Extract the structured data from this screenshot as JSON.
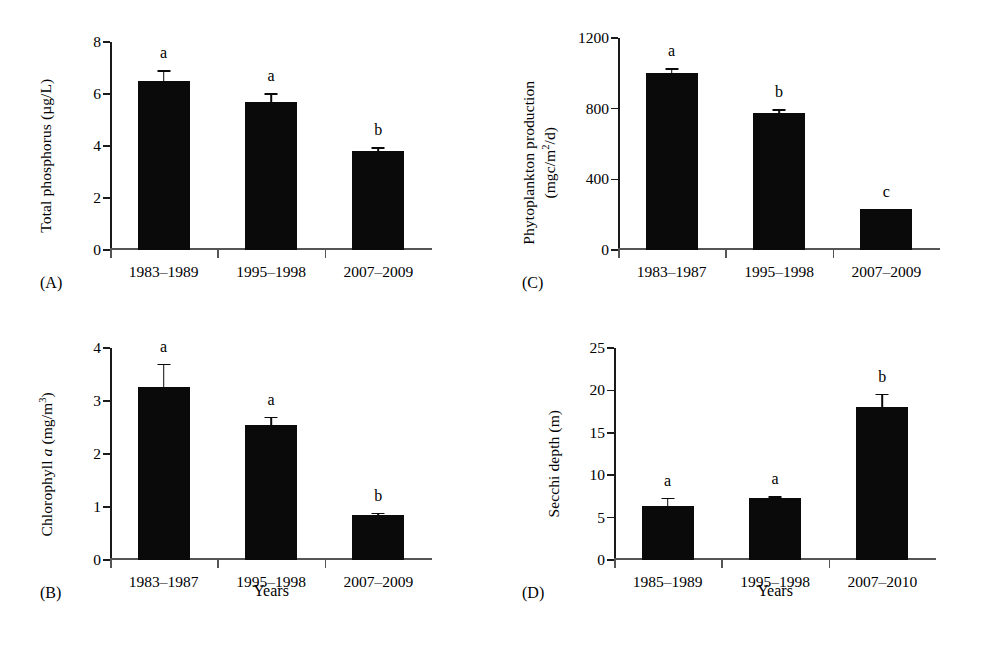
{
  "figure": {
    "background": "#ffffff",
    "bar_color": "#0a0a0a",
    "axis_color": "#1a1a1a"
  },
  "panels": [
    {
      "tag": "(A)",
      "ylabel": "Total phosphorus (µg/L)",
      "xaxis_title": "",
      "yticks": [
        "0",
        "2",
        "4",
        "6",
        "8"
      ]
    },
    {
      "tag": "(B)",
      "ylabel_prefix": "Chlorophyll ",
      "ylabel_italic": "a",
      "ylabel_suffix": " (mg/m",
      "ylabel_sup": "3",
      "ylabel_end": ")",
      "xaxis_title": "Years",
      "yticks": [
        "0",
        "1",
        "2",
        "3",
        "4"
      ]
    },
    {
      "tag": "(C)",
      "ylabel_line1": "Phytoplankton production",
      "ylabel_line2_prefix": "(mgc/m",
      "ylabel_line2_sup": "2",
      "ylabel_line2_suffix": "/d)",
      "xaxis_title": "",
      "yticks": [
        "0",
        "400",
        "800",
        "1200"
      ]
    },
    {
      "tag": "(D)",
      "ylabel": "Secchi depth (m)",
      "xaxis_title": "Years",
      "yticks": [
        "0",
        "5",
        "10",
        "15",
        "20",
        "25"
      ]
    }
  ],
  "chart_data": [
    {
      "panel": "A",
      "type": "bar",
      "title": "",
      "xlabel": "",
      "ylabel": "Total phosphorus (µg/L)",
      "ylim": [
        0,
        8
      ],
      "yticks": [
        0,
        2,
        4,
        6,
        8
      ],
      "grid": false,
      "legend": "none",
      "categories": [
        "1983–1989",
        "1995–1998",
        "2007–2009"
      ],
      "values": [
        6.5,
        5.68,
        3.8
      ],
      "errors": [
        0.42,
        0.34,
        0.15
      ],
      "annotations": [
        "a",
        "a",
        "b"
      ]
    },
    {
      "panel": "B",
      "type": "bar",
      "title": "",
      "xlabel": "Years",
      "ylabel": "Chlorophyll a (mg/m3)",
      "ylim": [
        0,
        4
      ],
      "yticks": [
        0,
        1,
        2,
        3,
        4
      ],
      "grid": false,
      "legend": "none",
      "categories": [
        "1983–1987",
        "1995–1998",
        "2007–2009"
      ],
      "values": [
        3.26,
        2.55,
        0.84
      ],
      "errors": [
        0.44,
        0.15,
        0.05
      ],
      "annotations": [
        "a",
        "a",
        "b"
      ]
    },
    {
      "panel": "C",
      "type": "bar",
      "title": "",
      "xlabel": "",
      "ylabel": "Phytoplankton production (mgc/m2/d)",
      "ylim": [
        0,
        1200
      ],
      "yticks": [
        0,
        400,
        800,
        1200
      ],
      "grid": false,
      "legend": "none",
      "categories": [
        "1983–1987",
        "1995–1998",
        "2007–2009"
      ],
      "values": [
        1000,
        775,
        230
      ],
      "errors": [
        30,
        22,
        0
      ],
      "annotations": [
        "a",
        "b",
        "c"
      ]
    },
    {
      "panel": "D",
      "type": "bar",
      "title": "",
      "xlabel": "Years",
      "ylabel": "Secchi depth (m)",
      "ylim": [
        0,
        25
      ],
      "yticks": [
        0,
        5,
        10,
        15,
        20,
        25
      ],
      "grid": false,
      "legend": "none",
      "categories": [
        "1985–1989",
        "1995–1998",
        "2007–2010"
      ],
      "values": [
        6.4,
        7.3,
        18.1
      ],
      "errors": [
        0.95,
        0.25,
        1.5
      ],
      "annotations": [
        "a",
        "a",
        "b"
      ]
    }
  ]
}
